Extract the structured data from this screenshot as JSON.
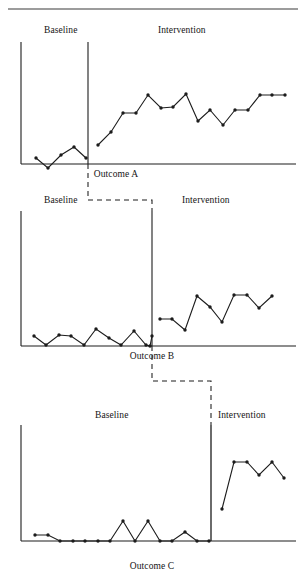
{
  "figure": {
    "title": "",
    "top_rule": {
      "x1": 8,
      "y1": 9,
      "x2": 298,
      "y2": 9,
      "color": "#3a3a3a"
    },
    "ink_color": "#1c1c1c",
    "background": "#ffffff"
  },
  "panels": [
    {
      "id": "outcome-a",
      "baseline_label": "Baseline",
      "intervention_label": "Intervention",
      "outcome_label": "Outcome A",
      "baseline_label_pos": {
        "x": 44,
        "y": 26
      },
      "intervention_label_pos": {
        "x": 158,
        "y": 26
      },
      "outcome_label_pos": {
        "x": 116,
        "y": 170
      },
      "axes": {
        "y_axis": {
          "x": 21,
          "y_top": 42,
          "y_bottom": 164
        },
        "x_axis": {
          "y": 164,
          "x_left": 21,
          "x_right": 296
        },
        "phase_line": {
          "x": 88,
          "y_top": 42,
          "y_bottom": 164
        }
      }
    },
    {
      "id": "outcome-b",
      "baseline_label": "Baseline",
      "intervention_label": "Intervention",
      "outcome_label": "Outcome B",
      "baseline_label_pos": {
        "x": 44,
        "y": 196
      },
      "intervention_label_pos": {
        "x": 182,
        "y": 196
      },
      "outcome_label_pos": {
        "x": 152,
        "y": 352
      },
      "axes": {
        "y_axis": {
          "x": 21,
          "y_top": 211,
          "y_bottom": 346
        },
        "x_axis": {
          "y": 346,
          "x_left": 21,
          "x_right": 296
        },
        "phase_line": {
          "x": 152,
          "y_top": 211,
          "y_bottom": 346
        }
      }
    },
    {
      "id": "outcome-c",
      "baseline_label": "Baseline",
      "intervention_label": "Intervention",
      "outcome_label": "Outcome C",
      "baseline_label_pos": {
        "x": 95,
        "y": 411
      },
      "intervention_label_pos": {
        "x": 218,
        "y": 411
      },
      "outcome_label_pos": {
        "x": 152,
        "y": 562
      },
      "axes": {
        "y_axis": {
          "x": 21,
          "y_top": 425,
          "y_bottom": 541
        },
        "x_axis": {
          "y": 541,
          "x_left": 21,
          "x_right": 296
        },
        "phase_line": {
          "x": 211,
          "y_top": 425,
          "y_bottom": 541
        }
      }
    }
  ],
  "connectors": [
    {
      "id": "connector-a-to-b",
      "from_panel": "outcome-a",
      "to_panel": "outcome-b",
      "points": [
        [
          88,
          164
        ],
        [
          88,
          200
        ],
        [
          152,
          200
        ],
        [
          152,
          211
        ]
      ]
    },
    {
      "id": "connector-b-to-c",
      "from_panel": "outcome-b",
      "to_panel": "outcome-c",
      "points": [
        [
          152,
          346
        ],
        [
          152,
          381
        ],
        [
          211,
          381
        ],
        [
          211,
          425
        ]
      ]
    }
  ],
  "chart_data": [
    {
      "type": "line",
      "id": "outcome-a",
      "title": "Outcome A",
      "xlabel": "",
      "ylabel": "",
      "grid": false,
      "legend": false,
      "phase_change_session": 7.5,
      "phases": [
        {
          "name": "Baseline",
          "x": [
            1,
            2,
            3,
            4,
            5
          ],
          "y": [
            12,
            3,
            17,
            27,
            15
          ],
          "points_px": [
            [
              36,
              158
            ],
            [
              48,
              168
            ],
            [
              61,
              155
            ],
            [
              74,
              147
            ],
            [
              86,
              158
            ]
          ]
        },
        {
          "name": "Intervention",
          "x": [
            6,
            7,
            8,
            9,
            10,
            11,
            12,
            13,
            14,
            15,
            16,
            17,
            18,
            19,
            20,
            21
          ],
          "y": [
            30,
            52,
            76,
            76,
            97,
            82,
            82,
            99,
            64,
            78,
            57,
            78,
            78,
            97,
            97,
            97
          ],
          "points_px": [
            [
              98,
              145
            ],
            [
              111,
              132
            ],
            [
              123,
              113
            ],
            [
              136,
              113
            ],
            [
              148,
              95
            ],
            [
              161,
              108
            ],
            [
              173,
              107
            ],
            [
              186,
              94
            ],
            [
              198,
              121
            ],
            [
              210,
              110
            ],
            [
              223,
              125
            ],
            [
              235,
              110
            ],
            [
              248,
              110
            ],
            [
              260,
              95
            ],
            [
              272,
              95
            ],
            [
              285,
              95
            ]
          ]
        }
      ],
      "series": [
        {
          "name": "Outcome A",
          "values": [
            12,
            3,
            17,
            27,
            15,
            30,
            52,
            76,
            76,
            97,
            82,
            82,
            99,
            64,
            78,
            57,
            78,
            78,
            97,
            97,
            97
          ]
        }
      ],
      "categories": [
        1,
        2,
        3,
        4,
        5,
        6,
        7,
        8,
        9,
        10,
        11,
        12,
        13,
        14,
        15,
        16,
        17,
        18,
        19,
        20,
        21
      ]
    },
    {
      "type": "line",
      "id": "outcome-b",
      "title": "Outcome B",
      "xlabel": "",
      "ylabel": "",
      "grid": false,
      "legend": false,
      "phase_change_session": 12.5,
      "phases": [
        {
          "name": "Baseline",
          "x": [
            1,
            2,
            3,
            4,
            5,
            6,
            7,
            8,
            9,
            10,
            11,
            12
          ],
          "y": [
            10,
            1,
            11,
            10,
            1,
            18,
            7,
            1,
            17,
            1,
            0,
            12
          ],
          "points_px": [
            [
              34,
              336
            ],
            [
              46,
              345
            ],
            [
              59,
              335
            ],
            [
              71,
              336
            ],
            [
              84,
              345
            ],
            [
              96,
              329
            ],
            [
              109,
              338
            ],
            [
              121,
              345
            ],
            [
              134,
              331
            ],
            [
              146,
              345
            ],
            [
              150,
              346
            ],
            [
              152,
              336
            ]
          ]
        },
        {
          "name": "Intervention",
          "x": [
            13,
            14,
            15,
            16,
            17,
            18,
            19,
            20,
            21,
            22
          ],
          "y": [
            40,
            40,
            30,
            63,
            53,
            38,
            65,
            65,
            52,
            64
          ],
          "points_px": [
            [
              160,
              319
            ],
            [
              172,
              319
            ],
            [
              185,
              330
            ],
            [
              197,
              296
            ],
            [
              210,
              307
            ],
            [
              222,
              322
            ],
            [
              234,
              295
            ],
            [
              247,
              295
            ],
            [
              259,
              308
            ],
            [
              272,
              296
            ]
          ]
        }
      ],
      "series": [
        {
          "name": "Outcome B",
          "values": [
            10,
            1,
            11,
            10,
            1,
            18,
            7,
            1,
            17,
            1,
            0,
            12,
            40,
            40,
            30,
            63,
            53,
            38,
            65,
            65,
            52,
            64
          ]
        }
      ],
      "categories": [
        1,
        2,
        3,
        4,
        5,
        6,
        7,
        8,
        9,
        10,
        11,
        12,
        13,
        14,
        15,
        16,
        17,
        18,
        19,
        20,
        21,
        22
      ]
    },
    {
      "type": "line",
      "id": "outcome-c",
      "title": "Outcome C",
      "xlabel": "",
      "ylabel": "",
      "grid": false,
      "legend": false,
      "phase_change_session": 15.5,
      "phases": [
        {
          "name": "Baseline",
          "x": [
            1,
            2,
            3,
            4,
            5,
            6,
            7,
            8,
            9,
            10,
            11,
            12,
            13,
            14,
            15
          ],
          "y": [
            11,
            11,
            1,
            1,
            1,
            1,
            1,
            22,
            1,
            22,
            1,
            1,
            12,
            1,
            1
          ],
          "points_px": [
            [
              35,
              535
            ],
            [
              48,
              535
            ],
            [
              60,
              541
            ],
            [
              73,
              541
            ],
            [
              85,
              541
            ],
            [
              98,
              541
            ],
            [
              110,
              541
            ],
            [
              123,
              521
            ],
            [
              135,
              541
            ],
            [
              148,
              521
            ],
            [
              160,
              541
            ],
            [
              172,
              541
            ],
            [
              185,
              532
            ],
            [
              197,
              541
            ],
            [
              209,
              541
            ]
          ]
        },
        {
          "name": "Intervention",
          "x": [
            16,
            17,
            18,
            19,
            20,
            21
          ],
          "y": [
            28,
            88,
            88,
            75,
            88,
            72
          ],
          "points_px": [
            [
              222,
              509
            ],
            [
              234,
              462
            ],
            [
              247,
              462
            ],
            [
              259,
              475
            ],
            [
              272,
              462
            ],
            [
              284,
              478
            ]
          ]
        }
      ],
      "series": [
        {
          "name": "Outcome C",
          "values": [
            11,
            11,
            1,
            1,
            1,
            1,
            1,
            22,
            1,
            22,
            1,
            1,
            12,
            1,
            1,
            28,
            88,
            88,
            75,
            88,
            72
          ]
        }
      ],
      "categories": [
        1,
        2,
        3,
        4,
        5,
        6,
        7,
        8,
        9,
        10,
        11,
        12,
        13,
        14,
        15,
        16,
        17,
        18,
        19,
        20,
        21
      ]
    }
  ]
}
